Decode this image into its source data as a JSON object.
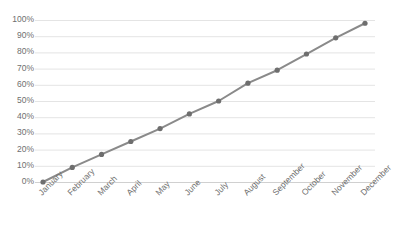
{
  "chart_data": {
    "type": "line",
    "title": "",
    "subtitle": "",
    "xlabel": "",
    "ylabel": "",
    "categories": [
      "January",
      "February",
      "March",
      "April",
      "May",
      "June",
      "July",
      "August",
      "September",
      "October",
      "November",
      "December"
    ],
    "series": [
      {
        "name": "Cumulative Progress",
        "values": [
          0,
          9,
          17,
          25,
          33,
          42,
          50,
          61,
          69,
          79,
          89,
          98
        ]
      }
    ],
    "values": [
      0,
      9,
      17,
      25,
      33,
      42,
      50,
      61,
      69,
      79,
      89,
      98
    ],
    "ylim": [
      0,
      100
    ],
    "y_ticks": [
      0,
      10,
      20,
      30,
      40,
      50,
      60,
      70,
      80,
      90,
      100
    ],
    "y_tick_labels": [
      "0%",
      "10%",
      "20%",
      "30%",
      "40%",
      "50%",
      "60%",
      "70%",
      "80%",
      "90%",
      "100%"
    ],
    "grid": {
      "horizontal": true,
      "vertical": false,
      "color": "#e4e4e4"
    },
    "legend": {
      "visible": false,
      "position": "none"
    },
    "axis": {
      "x_label_rotation": -45,
      "x_axis_line_color": "#d0d0d0",
      "y_axis_line": false
    },
    "style": {
      "line_color": "#8a8a8a",
      "line_width": 2,
      "marker": "circle",
      "marker_color": "#6e6e6e",
      "marker_size": 4,
      "text_color": "#6f6f6f",
      "background": "#ffffff"
    }
  }
}
